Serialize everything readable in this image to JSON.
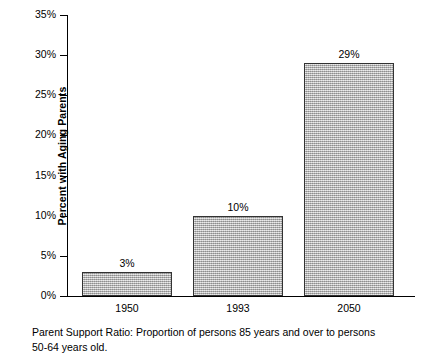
{
  "chart_data": {
    "type": "bar",
    "title": "",
    "subtitle": "",
    "xlabel": "",
    "ylabel": "Percent with Aging Parents",
    "categories": [
      "1950",
      "1993",
      "2050"
    ],
    "values": [
      3,
      10,
      29
    ],
    "value_labels": [
      "3%",
      "10%",
      "29%"
    ],
    "ylim": [
      0,
      35
    ],
    "ytick_values": [
      0,
      5,
      10,
      15,
      20,
      25,
      30,
      35
    ],
    "ytick_labels": [
      "0%",
      "5%",
      "10%",
      "15%",
      "20%",
      "25%",
      "30%",
      "35%"
    ],
    "grid": false,
    "legend": null,
    "series": [
      {
        "name": "Percent with Aging Parents",
        "values": [
          3,
          10,
          29
        ]
      }
    ],
    "bar_fill_color": "#b4b4b4",
    "bar_border_color": "#333333",
    "axis_color": "#000000",
    "background_color": "#ffffff"
  },
  "caption": {
    "line1": "Parent Support Ratio: Proportion of persons 85 years and over to persons",
    "line2": "50-64 years old."
  }
}
